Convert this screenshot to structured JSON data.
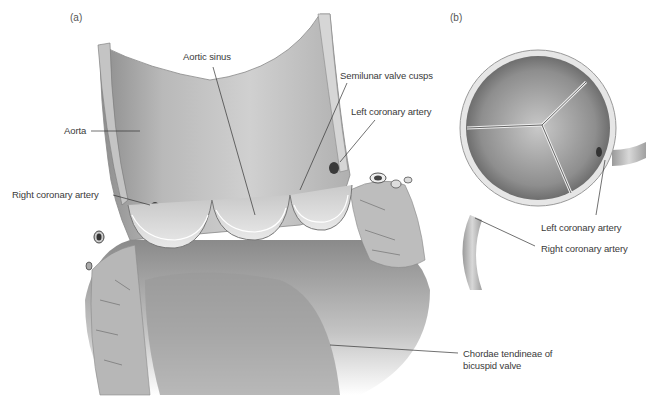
{
  "panels": {
    "a": "(a)",
    "b": "(b)"
  },
  "labels_a": {
    "aortic_sinus": "Aortic sinus",
    "semilunar_valve_cusps": "Semilunar valve cusps",
    "left_coronary_artery": "Left coronary artery",
    "aorta": "Aorta",
    "right_coronary_artery": "Right coronary artery",
    "chordae_line1": "Chordae tendineae of",
    "chordae_line2": "bicuspid valve"
  },
  "labels_b": {
    "left_coronary_artery": "Left coronary artery",
    "right_coronary_artery": "Right coronary artery"
  },
  "colors": {
    "tissue_light": "#d9d9d9",
    "tissue_mid": "#a9a9a9",
    "tissue_dark": "#5a5a5a",
    "leader_line": "#333333",
    "label_text": "#3a3a3a"
  }
}
